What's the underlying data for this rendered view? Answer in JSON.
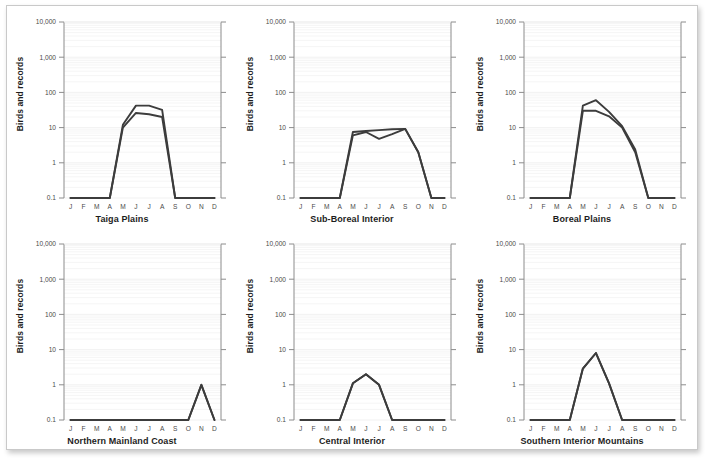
{
  "figure": {
    "axis_y_label": "Birds and records",
    "y_ticks": [
      "10,000",
      "1,000",
      "100",
      "10",
      "1",
      "0.1"
    ],
    "y_tick_values": [
      10000,
      1000,
      100,
      10,
      1,
      0.1
    ],
    "x_ticks": [
      "J",
      "F",
      "M",
      "A",
      "M",
      "J",
      "J",
      "A",
      "S",
      "O",
      "N",
      "D"
    ],
    "line_color": "#3c3c3c",
    "grid_color": "#ededed",
    "axis_color": "#8c8c8c",
    "background": "#ffffff"
  },
  "chart_data": [
    {
      "type": "line",
      "title": "Taiga Plains",
      "xlabel": "",
      "ylabel": "Birds and records",
      "yscale": "log",
      "ylim": [
        0.1,
        10000
      ],
      "grid": true,
      "legend": "none",
      "categories": [
        "J",
        "F",
        "M",
        "A",
        "M",
        "J",
        "J",
        "A",
        "S",
        "O",
        "N",
        "D"
      ],
      "series": [
        {
          "name": "Records",
          "values": [
            0.1,
            0.1,
            0.1,
            0.1,
            12,
            42,
            42,
            32,
            0.1,
            0.1,
            0.1,
            0.1
          ]
        },
        {
          "name": "Birds",
          "values": [
            0.1,
            0.1,
            0.1,
            0.1,
            10,
            26,
            24,
            20,
            0.1,
            0.1,
            0.1,
            0.1
          ]
        }
      ]
    },
    {
      "type": "line",
      "title": "Sub-Boreal Interior",
      "xlabel": "",
      "ylabel": "Birds and records",
      "yscale": "log",
      "ylim": [
        0.1,
        10000
      ],
      "grid": true,
      "legend": "none",
      "categories": [
        "J",
        "F",
        "M",
        "A",
        "M",
        "J",
        "J",
        "A",
        "S",
        "O",
        "N",
        "D"
      ],
      "series": [
        {
          "name": "Records",
          "values": [
            0.1,
            0.1,
            0.1,
            0.1,
            7.5,
            8,
            8.5,
            9,
            9.2,
            2,
            0.1,
            0.1
          ]
        },
        {
          "name": "Birds",
          "values": [
            0.1,
            0.1,
            0.1,
            0.1,
            6,
            7.5,
            4.8,
            6.5,
            9.2,
            2,
            0.1,
            0.1
          ]
        }
      ]
    },
    {
      "type": "line",
      "title": "Boreal Plains",
      "xlabel": "",
      "ylabel": "Birds and records",
      "yscale": "log",
      "ylim": [
        0.1,
        10000
      ],
      "grid": true,
      "legend": "none",
      "categories": [
        "J",
        "F",
        "M",
        "A",
        "M",
        "J",
        "J",
        "A",
        "S",
        "O",
        "N",
        "D"
      ],
      "series": [
        {
          "name": "Records",
          "values": [
            0.1,
            0.1,
            0.1,
            0.1,
            42,
            60,
            28,
            11,
            2.4,
            0.1,
            0.1,
            0.1
          ]
        },
        {
          "name": "Birds",
          "values": [
            0.1,
            0.1,
            0.1,
            0.1,
            30,
            30,
            21,
            10,
            2.0,
            0.1,
            0.1,
            0.1
          ]
        }
      ]
    },
    {
      "type": "line",
      "title": "Northern Mainland Coast",
      "xlabel": "",
      "ylabel": "Birds and records",
      "yscale": "log",
      "ylim": [
        0.1,
        10000
      ],
      "grid": true,
      "legend": "none",
      "categories": [
        "J",
        "F",
        "M",
        "A",
        "M",
        "J",
        "J",
        "A",
        "S",
        "O",
        "N",
        "D"
      ],
      "series": [
        {
          "name": "Records",
          "values": [
            0.1,
            0.1,
            0.1,
            0.1,
            0.1,
            0.1,
            0.1,
            0.1,
            0.1,
            0.1,
            1,
            0.1
          ]
        },
        {
          "name": "Birds",
          "values": [
            0.1,
            0.1,
            0.1,
            0.1,
            0.1,
            0.1,
            0.1,
            0.1,
            0.1,
            0.1,
            1,
            0.1
          ]
        }
      ]
    },
    {
      "type": "line",
      "title": "Central Interior",
      "xlabel": "",
      "ylabel": "Birds and records",
      "yscale": "log",
      "ylim": [
        0.1,
        10000
      ],
      "grid": true,
      "legend": "none",
      "categories": [
        "J",
        "F",
        "M",
        "A",
        "M",
        "J",
        "J",
        "A",
        "S",
        "O",
        "N",
        "D"
      ],
      "series": [
        {
          "name": "Records",
          "values": [
            0.1,
            0.1,
            0.1,
            0.1,
            1.1,
            2,
            1,
            0.1,
            0.1,
            0.1,
            0.1,
            0.1
          ]
        },
        {
          "name": "Birds",
          "values": [
            0.1,
            0.1,
            0.1,
            0.1,
            1.1,
            2,
            1,
            0.1,
            0.1,
            0.1,
            0.1,
            0.1
          ]
        }
      ]
    },
    {
      "type": "line",
      "title": "Southern Interior Mountains",
      "xlabel": "",
      "ylabel": "Birds and records",
      "yscale": "log",
      "ylim": [
        0.1,
        10000
      ],
      "grid": true,
      "legend": "none",
      "categories": [
        "J",
        "F",
        "M",
        "A",
        "M",
        "J",
        "J",
        "A",
        "S",
        "O",
        "N",
        "D"
      ],
      "series": [
        {
          "name": "Records",
          "values": [
            0.1,
            0.1,
            0.1,
            0.1,
            2.9,
            8,
            1.1,
            0.1,
            0.1,
            0.1,
            0.1,
            0.1
          ]
        },
        {
          "name": "Birds",
          "values": [
            0.1,
            0.1,
            0.1,
            0.1,
            2.9,
            8,
            1.1,
            0.1,
            0.1,
            0.1,
            0.1,
            0.1
          ]
        }
      ]
    }
  ]
}
